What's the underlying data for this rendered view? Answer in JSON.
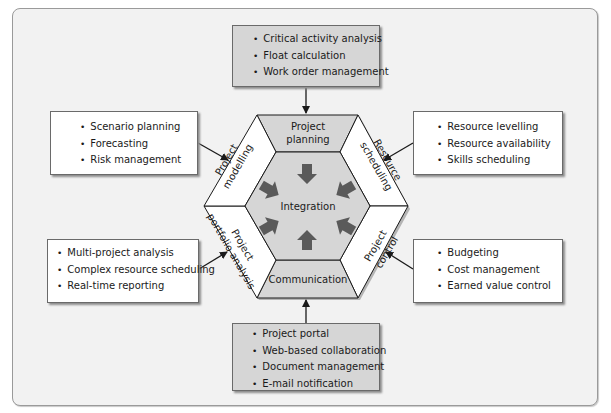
{
  "center": {
    "label": "Integration"
  },
  "segments": {
    "top": {
      "line1": "Project",
      "line2": "planning"
    },
    "top_right": {
      "line1": "Resource",
      "line2": "scheduling"
    },
    "bottom_right": {
      "line1": "Project",
      "line2": "control"
    },
    "bottom": {
      "line1": "Communication"
    },
    "bottom_left": {
      "line1": "Project",
      "line2": "portfolio analysis"
    },
    "top_left": {
      "line1": "Project",
      "line2": "modelling"
    }
  },
  "boxes": {
    "top": {
      "items": [
        "Critical activity analysis",
        "Float calculation",
        "Work order management"
      ]
    },
    "left_upper": {
      "items": [
        "Scenario planning",
        "Forecasting",
        "Risk management"
      ]
    },
    "right_upper": {
      "items": [
        "Resource levelling",
        "Resource availability",
        "Skills scheduling"
      ]
    },
    "left_lower": {
      "items": [
        "Multi-project analysis",
        "Complex resource scheduling",
        "Real-time reporting"
      ]
    },
    "right_lower": {
      "items": [
        "Budgeting",
        "Cost management",
        "Earned value control"
      ]
    },
    "bottom": {
      "items": [
        "Project portal",
        "Web-based collaboration",
        "Document management",
        "E-mail notification"
      ]
    }
  },
  "colors": {
    "frame_bg": "#f2f2f2",
    "grey_fill": "#d6d6d6",
    "white_fill": "#ffffff",
    "arrow_fill": "#5a5a5a",
    "line": "#1a1a1a"
  }
}
